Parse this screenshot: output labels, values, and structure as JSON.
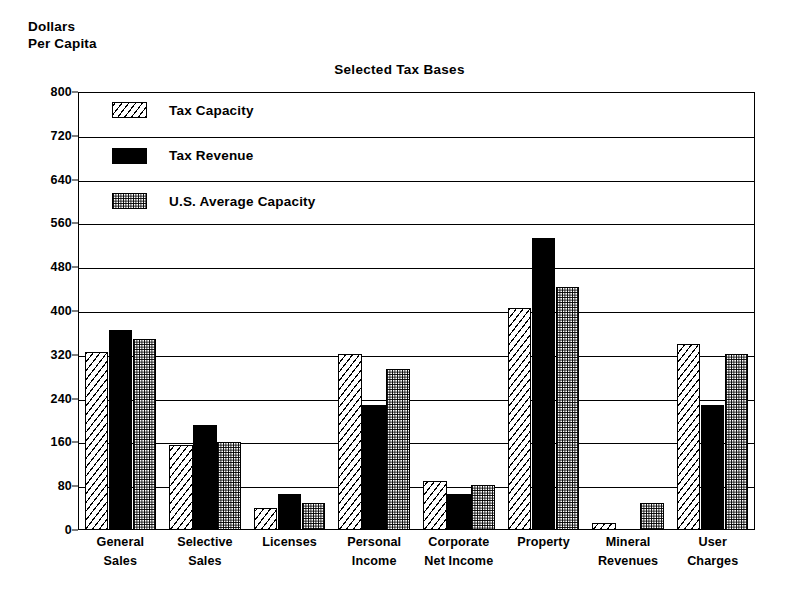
{
  "axis_corner_label": "Dollars\nPer Capita",
  "chart_data": {
    "type": "bar",
    "title": "Selected Tax Bases",
    "xlabel": "",
    "ylabel": "Dollars Per Capita",
    "ylim": [
      0,
      800
    ],
    "ytick_values": [
      0,
      80,
      160,
      240,
      320,
      400,
      480,
      560,
      640,
      720,
      800
    ],
    "ytick_labels": [
      "0",
      "80",
      "160",
      "240",
      "320",
      "400",
      "480",
      "560",
      "640",
      "720",
      "800"
    ],
    "grid": true,
    "legend_position": "upper-left inside",
    "categories": [
      "General\nSales",
      "Selective\nSales",
      "Licenses",
      "Personal\nIncome",
      "Corporate\nNet Income",
      "Property",
      "Mineral\nRevenues",
      "User\nCharges"
    ],
    "series": [
      {
        "name": "Tax Capacity",
        "fill": "diagonal-hatch",
        "values": [
          326,
          155,
          40,
          322,
          90,
          405,
          13,
          340
        ]
      },
      {
        "name": "Tax Revenue",
        "fill": "solid-black",
        "values": [
          365,
          192,
          65,
          228,
          65,
          533,
          0,
          228
        ]
      },
      {
        "name": "U.S. Average Capacity",
        "fill": "stipple",
        "values": [
          348,
          160,
          50,
          295,
          83,
          443,
          50,
          322
        ]
      }
    ]
  },
  "legend": {
    "items": [
      {
        "label": "Tax Capacity",
        "fill": "diagonal-hatch"
      },
      {
        "label": "Tax Revenue",
        "fill": "solid-black"
      },
      {
        "label": "U.S. Average Capacity",
        "fill": "stipple"
      }
    ]
  },
  "colors": {
    "ink": "#000000",
    "paper": "#ffffff"
  }
}
